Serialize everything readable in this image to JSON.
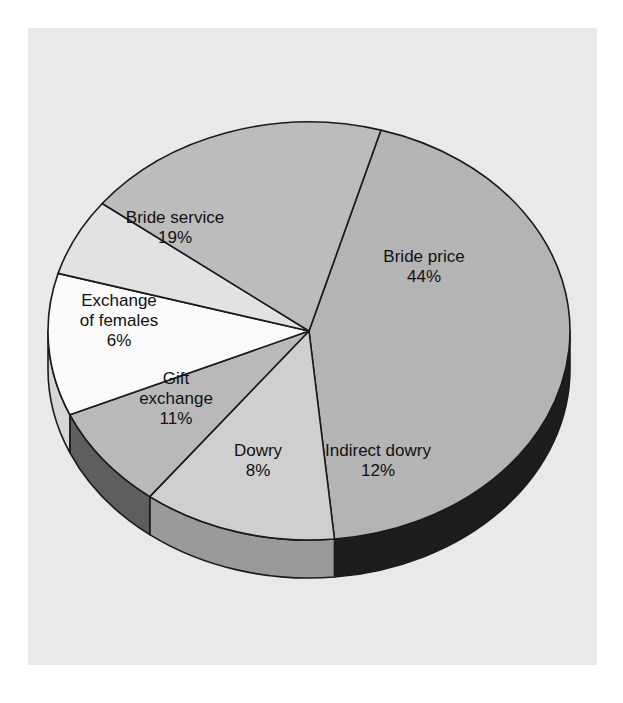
{
  "figure": {
    "background_color": "#ffffff",
    "panel_color": "#e9e9e9",
    "outline_color": "#1a1a1a"
  },
  "chart_data": {
    "type": "pie",
    "title": "",
    "subtitle": "",
    "xlabel": "",
    "ylabel": "",
    "legend_position": "none",
    "grid": false,
    "style": "3d-exploded-free",
    "units": "percent",
    "total": 100,
    "start_angle_deg": -74,
    "direction": "clockwise",
    "categories": [
      "Bride price",
      "Indirect dowry",
      "Dowry",
      "Gift exchange",
      "Exchange of females",
      "Bride service"
    ],
    "values": [
      44,
      12,
      8,
      11,
      6,
      19
    ],
    "slices": [
      {
        "name": "Bride price",
        "label": "Bride price",
        "value": 44,
        "value_label": "44%",
        "top_color": "#b4b4b4",
        "side_color": "#1d1d1d",
        "label_x": 424,
        "label_y": 268
      },
      {
        "name": "Indirect dowry",
        "label": "Indirect dowry",
        "value": 12,
        "value_label": "12%",
        "top_color": "#cfcfcf",
        "side_color": "#9a9a9a",
        "label_x": 378,
        "label_y": 462
      },
      {
        "name": "Dowry",
        "label": "Dowry",
        "value": 8,
        "value_label": "8%",
        "top_color": "#b9b9b9",
        "side_color": "#5e5e5e",
        "label_x": 258,
        "label_y": 462
      },
      {
        "name": "Gift exchange",
        "label": "Gift exchange",
        "value": 11,
        "value_label": "11%",
        "top_color": "#fafafa",
        "side_color": "#d6d6d6",
        "label_x": 176,
        "label_y": 400
      },
      {
        "name": "Exchange of females",
        "label": "Exchange of females",
        "value": 6,
        "value_label": "6%",
        "top_color": "#e2e2e2",
        "side_color": "#6b6b6b",
        "label_x": 119,
        "label_y": 322
      },
      {
        "name": "Bride service",
        "label": "Bride service",
        "value": 19,
        "value_label": "19%",
        "top_color": "#bcbcbc",
        "side_color": "#bcbcbc",
        "label_x": 175,
        "label_y": 229
      }
    ],
    "labels_multiline": {
      "Bride price": [
        "Bride price",
        "44%"
      ],
      "Indirect dowry": [
        "Indirect dowry",
        "12%"
      ],
      "Dowry": [
        "Dowry",
        "8%"
      ],
      "Gift exchange": [
        "Gift",
        "exchange",
        "11%"
      ],
      "Exchange of females": [
        "Exchange",
        "of females",
        "6%"
      ],
      "Bride service": [
        "Bride service",
        "19%"
      ]
    }
  },
  "geometry": {
    "center_x": 309,
    "center_y": 331,
    "radius_x": 261,
    "radius_y": 209,
    "depth": 38
  }
}
